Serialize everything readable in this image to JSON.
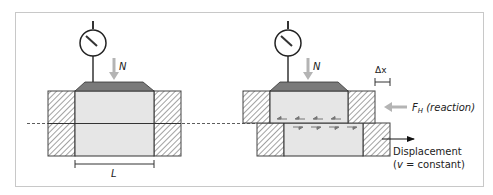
{
  "figure": {
    "left_panel": {
      "normal_force_label": "N",
      "length_label": "L"
    },
    "right_panel": {
      "normal_force_label": "N",
      "delta_label": "Δx",
      "reaction_label_main": "F",
      "reaction_label_sub": "H",
      "reaction_label_suffix": " (reaction)",
      "displacement_line1": "Displacement",
      "displacement_line2_prefix": "(",
      "displacement_line2_var": "v",
      "displacement_line2_suffix": " = constant)"
    },
    "colors": {
      "frame": "#c8c8c8",
      "soil": "#e6e6e6",
      "load_plate": "#7a7a7a",
      "arrow_gray": "#b4b4b4",
      "line": "#333333"
    }
  }
}
